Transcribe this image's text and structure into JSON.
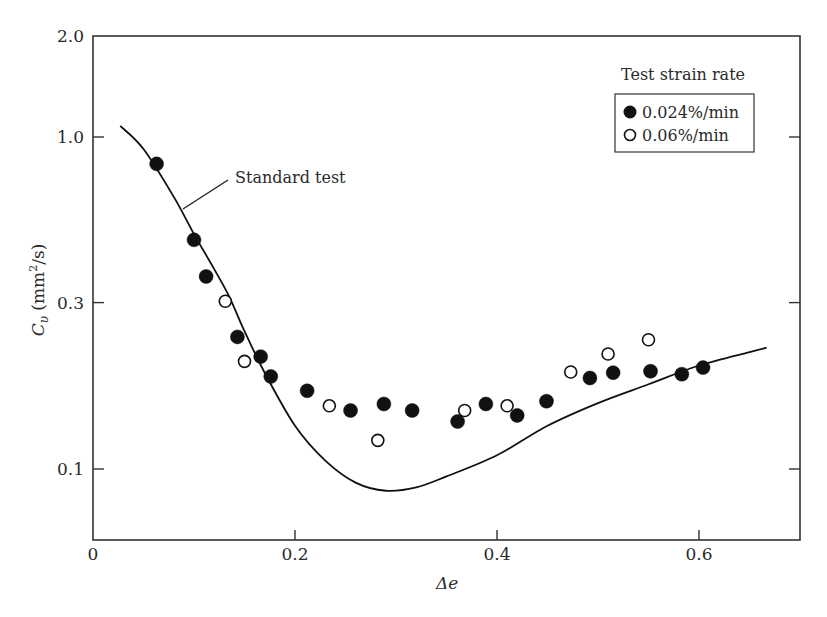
{
  "chart_data": {
    "type": "scatter",
    "title": "",
    "xlabel": "Δe",
    "ylabel": "Cv (mm²/s)",
    "ylabel_parts": {
      "symbol": "C",
      "subscript": "υ",
      "unit_open": " (mm",
      "unit_sup": "2",
      "unit_close": "/s)"
    },
    "xlim": [
      0,
      0.7
    ],
    "ylim": [
      0.06,
      2.0
    ],
    "yscale": "log",
    "grid": false,
    "x_ticks": [
      {
        "value": 0,
        "label": "0"
      },
      {
        "value": 0.2,
        "label": "0.2"
      },
      {
        "value": 0.4,
        "label": "0.4"
      },
      {
        "value": 0.6,
        "label": "0.6"
      }
    ],
    "y_ticks": [
      {
        "value": 0.1,
        "label": "0.1"
      },
      {
        "value": 0.3,
        "label": "0.3"
      },
      {
        "value": 1.0,
        "label": "1.0"
      },
      {
        "value": 2.0,
        "label": "2.0"
      }
    ],
    "legend": {
      "title": "Test strain rate",
      "position": "upper right",
      "entries": [
        {
          "label": "0.024%/min",
          "marker": "filled-circle"
        },
        {
          "label": "0.06%/min",
          "marker": "open-circle"
        }
      ]
    },
    "annotations": [
      {
        "text": "Standard test",
        "points_to": "curve",
        "x": 0.16,
        "y": 0.6
      }
    ],
    "series": [
      {
        "name": "0.024%/min",
        "marker": "filled-circle",
        "points": [
          [
            0.063,
            0.83
          ],
          [
            0.1,
            0.49
          ],
          [
            0.112,
            0.38
          ],
          [
            0.143,
            0.25
          ],
          [
            0.166,
            0.218
          ],
          [
            0.176,
            0.19
          ],
          [
            0.212,
            0.172
          ],
          [
            0.255,
            0.15
          ],
          [
            0.288,
            0.157
          ],
          [
            0.316,
            0.15
          ],
          [
            0.361,
            0.139
          ],
          [
            0.389,
            0.157
          ],
          [
            0.42,
            0.145
          ],
          [
            0.449,
            0.16
          ],
          [
            0.492,
            0.188
          ],
          [
            0.515,
            0.195
          ],
          [
            0.552,
            0.197
          ],
          [
            0.583,
            0.193
          ],
          [
            0.604,
            0.202
          ]
        ]
      },
      {
        "name": "0.06%/min",
        "marker": "open-circle",
        "points": [
          [
            0.131,
            0.32
          ],
          [
            0.15,
            0.211
          ],
          [
            0.234,
            0.155
          ],
          [
            0.282,
            0.122
          ],
          [
            0.368,
            0.15
          ],
          [
            0.41,
            0.155
          ],
          [
            0.473,
            0.196
          ],
          [
            0.51,
            0.222
          ],
          [
            0.55,
            0.245
          ]
        ]
      },
      {
        "name": "Standard test",
        "type": "line",
        "points": [
          [
            0.027,
            1.08
          ],
          [
            0.05,
            0.92
          ],
          [
            0.08,
            0.66
          ],
          [
            0.1,
            0.51
          ],
          [
            0.12,
            0.4
          ],
          [
            0.135,
            0.33
          ],
          [
            0.15,
            0.26
          ],
          [
            0.17,
            0.195
          ],
          [
            0.2,
            0.135
          ],
          [
            0.23,
            0.106
          ],
          [
            0.26,
            0.091
          ],
          [
            0.29,
            0.086
          ],
          [
            0.32,
            0.088
          ],
          [
            0.35,
            0.095
          ],
          [
            0.4,
            0.11
          ],
          [
            0.45,
            0.135
          ],
          [
            0.5,
            0.158
          ],
          [
            0.55,
            0.18
          ],
          [
            0.6,
            0.205
          ],
          [
            0.65,
            0.225
          ],
          [
            0.667,
            0.232
          ]
        ]
      }
    ]
  },
  "legend": {
    "title": "Test strain rate",
    "items": [
      "0.024%/min",
      "0.06%/min"
    ]
  },
  "annotation": {
    "standard_test": "Standard test"
  },
  "axes": {
    "xlabel": "Δe"
  }
}
